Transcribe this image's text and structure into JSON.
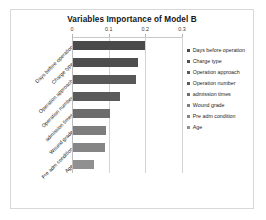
{
  "frame": {
    "border_color": "#d8d8d8",
    "background": "#ffffff"
  },
  "chart_data": {
    "type": "bar",
    "orientation": "horizontal",
    "title": "Variables Importance of Model B",
    "xlabel": "",
    "ylabel": "",
    "xlim": [
      0,
      0.3
    ],
    "xticks": [
      "0",
      "0.1",
      "0.2",
      "0.3"
    ],
    "xtick_values": [
      0,
      0.1,
      0.2,
      0.3
    ],
    "grid": true,
    "axis_position": "top",
    "legend_position": "right",
    "categories": [
      "Days before operation",
      "Charge type",
      "Operation approach",
      "Operation number",
      "admission times",
      "Wound grade",
      "Pre adm condition",
      "Age"
    ],
    "values": [
      0.196,
      0.177,
      0.172,
      0.128,
      0.1,
      0.09,
      0.086,
      0.057
    ],
    "colors": [
      "#4a4a4a",
      "#4e4e4e",
      "#585858",
      "#5a5a5a",
      "#6c6c6c",
      "#7d7d7d",
      "#858585",
      "#909090"
    ]
  },
  "legend": {
    "entries": [
      {
        "label": "Days before operation",
        "color": "#4a4a4a"
      },
      {
        "label": "Charge type",
        "color": "#4e4e4e"
      },
      {
        "label": "Operation approach",
        "color": "#585858"
      },
      {
        "label": "Operation number",
        "color": "#5a5a5a"
      },
      {
        "label": "admission times",
        "color": "#6c6c6c"
      },
      {
        "label": "Wound grade",
        "color": "#7d7d7d"
      },
      {
        "label": "Pre adm condition",
        "color": "#858585"
      },
      {
        "label": "Age",
        "color": "#909090"
      }
    ]
  }
}
